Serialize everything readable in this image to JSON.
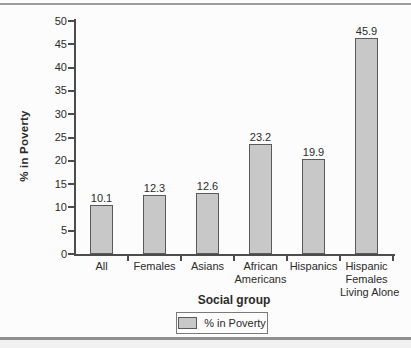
{
  "chart_data": {
    "type": "bar",
    "title": "",
    "categories": [
      "All",
      "Females",
      "Asians",
      "African Americans",
      "Hispanics",
      "Hispanic Females Living Alone"
    ],
    "category_lines": [
      [
        "All"
      ],
      [
        "Females"
      ],
      [
        "Asians"
      ],
      [
        "African",
        "Americans"
      ],
      [
        "Hispanics"
      ],
      [
        "Hispanic",
        "Females",
        "Living Alone"
      ]
    ],
    "values": [
      10.1,
      12.3,
      12.6,
      23.2,
      19.9,
      45.9
    ],
    "value_labels": [
      "10.1",
      "12.3",
      "12.6",
      "23.2",
      "19.9",
      "45.9"
    ],
    "xlabel": "Social group",
    "ylabel": "% in Poverty",
    "ylim": [
      0,
      50
    ],
    "ytick_step": 5,
    "ytick_labels": [
      "0",
      "5",
      "10",
      "15",
      "20",
      "25",
      "30",
      "35",
      "40",
      "45",
      "50"
    ],
    "grid": false,
    "legend": {
      "label": "% in Poverty",
      "position": "bottom-center"
    },
    "colors": {
      "bar_fill": "#c8c8c8",
      "bar_border": "#5a5a5a",
      "axis": "#4c4c4c",
      "text": "#2b2b2b",
      "rule": "#9b9b9b"
    }
  }
}
